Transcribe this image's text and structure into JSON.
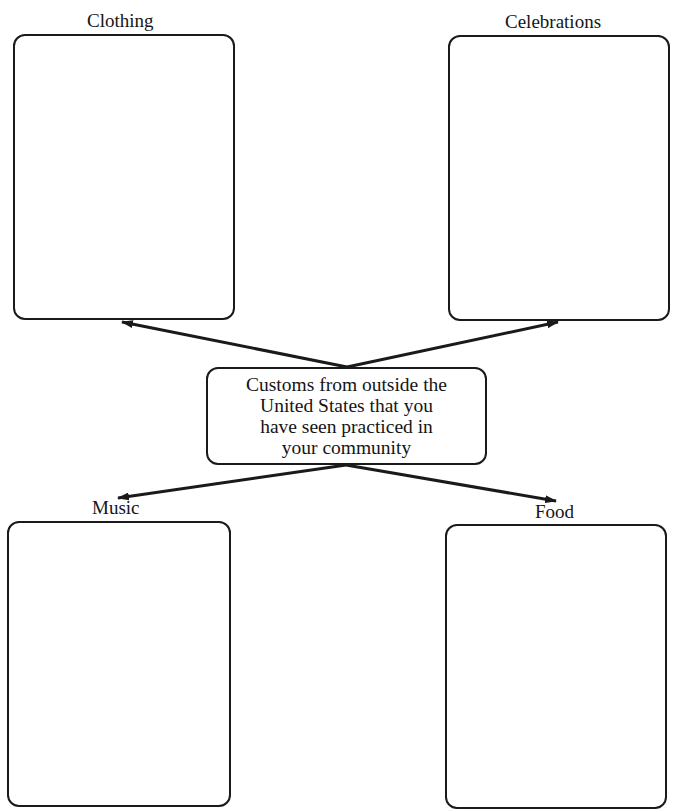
{
  "diagram": {
    "center": {
      "lines": [
        "Customs from outside the",
        "United States that you",
        "have seen practiced in",
        "your community"
      ]
    },
    "branches": [
      {
        "label": "Clothing",
        "position": "top-left",
        "content": ""
      },
      {
        "label": "Celebrations",
        "position": "top-right",
        "content": ""
      },
      {
        "label": "Music",
        "position": "bottom-left",
        "content": ""
      },
      {
        "label": "Food",
        "position": "bottom-right",
        "content": ""
      }
    ]
  },
  "colors": {
    "stroke": "#1a1a1a",
    "background": "#ffffff"
  }
}
